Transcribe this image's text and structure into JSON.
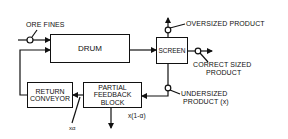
{
  "diagram": {
    "inputs": {
      "ore_fines": "ORE FINES"
    },
    "blocks": {
      "drum": "DRUM",
      "screen": "SCREEN",
      "return_conveyor_line1": "RETURN",
      "return_conveyor_line2": "CONVEYOR",
      "partial_feedback_line1": "PARTIAL",
      "partial_feedback_line2": "FEEDBACK",
      "partial_feedback_line3": "BLOCK"
    },
    "outputs": {
      "oversized": "OVERSIZED PRODUCT",
      "correct_line1": "CORRECT SIZED",
      "correct_line2": "PRODUCT",
      "undersized_line1": "UNDERSIZED",
      "undersized_line2": "PRODUCT (x)",
      "removed": "x(1-α)",
      "feedback_input": "xα"
    }
  }
}
